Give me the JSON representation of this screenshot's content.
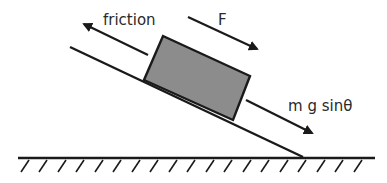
{
  "diagram": {
    "labels": {
      "friction": "friction",
      "applied_force": "F",
      "gravity_component": "m g sinθ"
    },
    "colors": {
      "line": "#1a1a1a",
      "block_fill": "#8c8c8c",
      "background": "#ffffff"
    },
    "geometry": {
      "incline": {
        "x1": 70,
        "y1": 47,
        "x2": 303,
        "y2": 157
      },
      "ground": {
        "x1": 18,
        "y1": 158,
        "x2": 375,
        "y2": 158
      },
      "block": [
        [
          163,
          36
        ],
        [
          250,
          76
        ],
        [
          233,
          120
        ],
        [
          144,
          80
        ]
      ],
      "arrows": {
        "friction": {
          "x1": 148,
          "y1": 55,
          "x2": 84,
          "y2": 24
        },
        "applied_force": {
          "x1": 188,
          "y1": 17,
          "x2": 257,
          "y2": 49
        },
        "gravity_component": {
          "x1": 246,
          "y1": 100,
          "x2": 312,
          "y2": 133
        }
      },
      "hatch_count": 19
    }
  }
}
